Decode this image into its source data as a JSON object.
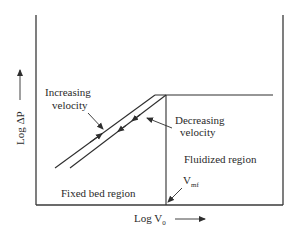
{
  "diagram": {
    "y_axis_label": "Log ΔP",
    "x_axis_label_main": "Log V",
    "x_axis_label_sub": "0",
    "labels": {
      "increasing_line1": "Increasing",
      "increasing_line2": "velocity",
      "decreasing_line1": "Decreasing",
      "decreasing_line2": "velocity",
      "fluidized_region": "Fluidized region",
      "fixed_bed_region": "Fixed bed region",
      "vmf_main": "V",
      "vmf_sub": "mf"
    },
    "colors": {
      "line": "#2e2e2e",
      "text": "#2a2a2a",
      "background": "#ffffff"
    }
  }
}
